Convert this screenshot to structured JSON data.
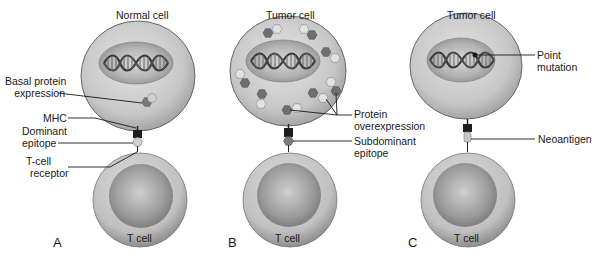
{
  "figure": {
    "panels": [
      {
        "letter": "A",
        "title": "Normal cell",
        "tcell_label": "T cell",
        "labels": {
          "basal_protein_line1": "Basal protein",
          "basal_protein_line2": "expression",
          "mhc": "MHC",
          "dominant_line1": "Dominant",
          "dominant_line2": "epitope",
          "tcr_line1": "T-cell",
          "tcr_line2": "receptor"
        }
      },
      {
        "letter": "B",
        "title": "Tumor cell",
        "tcell_label": "T cell",
        "labels": {
          "protein_line1": "Protein",
          "protein_line2": "overexpression",
          "subdominant_line1": "Subdominant",
          "subdominant_line2": "epitope"
        }
      },
      {
        "letter": "C",
        "title": "Tumor cell",
        "tcell_label": "T cell",
        "labels": {
          "point_line1": "Point",
          "point_line2": "mutation",
          "neoantigen": "Neoantigen"
        }
      }
    ],
    "colors": {
      "cell_body": "#c8c8c8",
      "cell_outline": "#555555",
      "nucleus": "#a8a8a8",
      "tcell_outer": "#c4c4c4",
      "tcell_inner": "#a0a0a0",
      "protein_dark": "#6f6f6f",
      "protein_light": "#d8d8d8",
      "mhc": "#1e1e1e",
      "leader_line": "#1a1a1a"
    }
  }
}
